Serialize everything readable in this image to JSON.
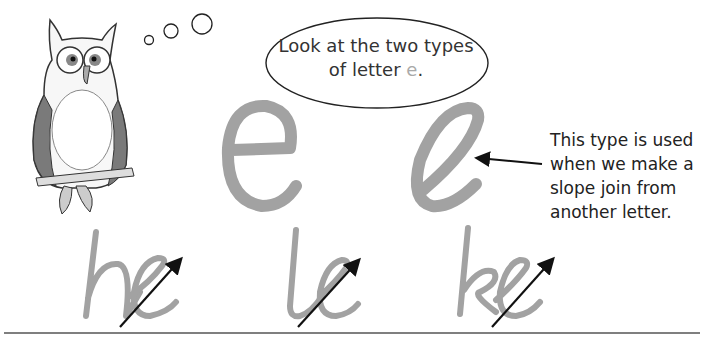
{
  "speech_bubble": {
    "line1": "Look at the two types",
    "line2_prefix": "of letter ",
    "line2_letter": "e",
    "line2_suffix": "."
  },
  "annotation": {
    "lines": [
      "This type is used",
      "when we make a",
      "slope join from",
      "another letter."
    ]
  },
  "examples": {
    "standalone_letters": [
      "e",
      "e"
    ],
    "joined_pairs": [
      "he",
      "le",
      "ke"
    ]
  },
  "icons": {
    "mascot": "owl-illustration",
    "thought_bubbles": "thought-bubble-icon",
    "pointer_arrow": "arrow-left-icon",
    "join_arrows": "arrow-up-right-icon"
  },
  "colors": {
    "letter_gray": "#a2a2a2",
    "text": "#333333",
    "line": "#555555"
  }
}
